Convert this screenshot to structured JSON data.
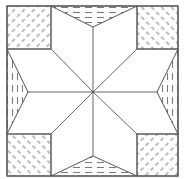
{
  "diagram": {
    "canvas": {
      "width": 185,
      "height": 179
    },
    "colors": {
      "background": "#ffffff",
      "line": "#555555",
      "hatch": "#6a6a6a"
    },
    "outer_square": {
      "x1": 7,
      "y1": 6,
      "x2": 178,
      "y2": 176
    },
    "center": {
      "x": 93,
      "y": 92
    },
    "corner_squares": [
      {
        "id": "top-left",
        "x": 7,
        "y": 6,
        "w": 44,
        "h": 43,
        "hatch": "diagonal-ne"
      },
      {
        "id": "top-right",
        "x": 137,
        "y": 6,
        "w": 41,
        "h": 43,
        "hatch": "diagonal-nw"
      },
      {
        "id": "bottom-left",
        "x": 7,
        "y": 134,
        "w": 44,
        "h": 42,
        "hatch": "diagonal-nw"
      },
      {
        "id": "bottom-right",
        "x": 137,
        "y": 134,
        "w": 41,
        "h": 42,
        "hatch": "diagonal-ne"
      }
    ],
    "edge_triangles": [
      {
        "id": "top",
        "points": [
          [
            51,
            6
          ],
          [
            137,
            6
          ],
          [
            93,
            27
          ]
        ],
        "hatch": "horizontal"
      },
      {
        "id": "bottom",
        "points": [
          [
            51,
            176
          ],
          [
            137,
            176
          ],
          [
            93,
            156
          ]
        ],
        "hatch": "horizontal"
      },
      {
        "id": "left",
        "points": [
          [
            7,
            49
          ],
          [
            7,
            134
          ],
          [
            28,
            92
          ]
        ],
        "hatch": "vertical"
      },
      {
        "id": "right",
        "points": [
          [
            178,
            49
          ],
          [
            178,
            134
          ],
          [
            157,
            92
          ]
        ],
        "hatch": "vertical"
      }
    ],
    "star_points": 8
  }
}
